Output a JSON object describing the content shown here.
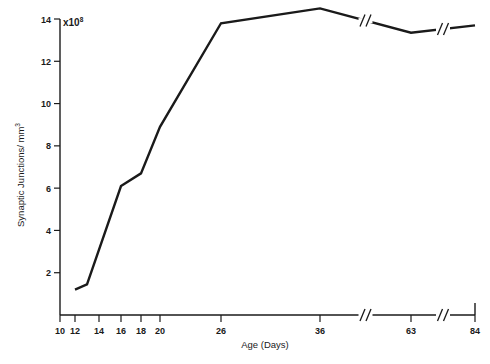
{
  "chart_data": {
    "type": "line",
    "title": "",
    "xlabel": "Age (Days)",
    "ylabel": "Synaptic Junctions/ mm",
    "ylabel_exponent": "3",
    "scale_note": "x10",
    "scale_note_exponent": "8",
    "x": [
      12,
      13,
      16,
      18,
      20,
      26,
      36,
      63,
      84
    ],
    "values": [
      1.2,
      1.45,
      6.1,
      6.7,
      8.9,
      13.8,
      14.5,
      13.35,
      13.7
    ],
    "xticks": [
      10,
      12,
      14,
      16,
      18,
      20,
      26,
      36,
      63,
      84
    ],
    "xtick_labels": [
      "10",
      "12",
      "14",
      "16",
      "18",
      "20",
      "26",
      "36",
      "63",
      "84"
    ],
    "yticks": [
      2,
      4,
      6,
      8,
      10,
      12,
      14
    ],
    "ytick_labels": [
      "2",
      "4",
      "6",
      "8",
      "10",
      "12",
      "14"
    ],
    "ylim": [
      0,
      14.6
    ],
    "grid": false,
    "legend": null,
    "axis_breaks": [
      "between 36 and 63",
      "between 63 and 84"
    ],
    "line_color": "#1a1a1a"
  }
}
